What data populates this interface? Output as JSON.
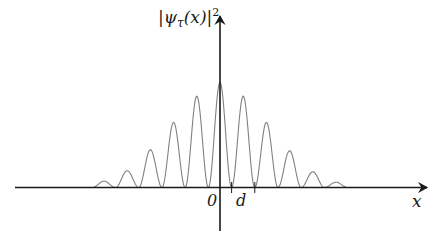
{
  "figure": {
    "y_label": {
      "prefix": "|",
      "psi": "ψ",
      "subscript": "τ",
      "arg": "(x)",
      "suffix": "|",
      "power": "2"
    },
    "x_label": "x",
    "origin_label": "0",
    "tick_label": "d",
    "colors": {
      "axis": "#1a1a1a",
      "curve": "#808080"
    }
  },
  "chart_data": {
    "type": "line",
    "title": "",
    "xlabel": "x",
    "ylabel": "|ψτ(x)|²",
    "peak_spacing_label": "d",
    "peaks": [
      {
        "n": -5,
        "height": 0.06
      },
      {
        "n": -4,
        "height": 0.16
      },
      {
        "n": -3,
        "height": 0.36
      },
      {
        "n": -2,
        "height": 0.62
      },
      {
        "n": -1,
        "height": 0.87
      },
      {
        "n": 0,
        "height": 1.0
      },
      {
        "n": 1,
        "height": 0.87
      },
      {
        "n": 2,
        "height": 0.62
      },
      {
        "n": 3,
        "height": 0.35
      },
      {
        "n": 4,
        "height": 0.15
      },
      {
        "n": 5,
        "height": 0.05
      }
    ],
    "x_ticks": [
      "0",
      "d"
    ],
    "grid": false,
    "legend": null
  }
}
